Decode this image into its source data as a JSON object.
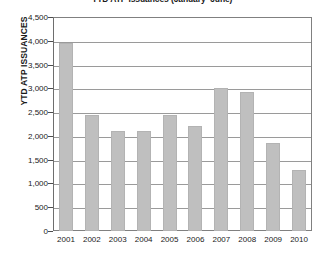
{
  "chart_data": {
    "type": "bar",
    "title": "YTD ATP Issuances (January–June)",
    "xlabel": "",
    "ylabel": "YTD ATP ISSUANCES",
    "categories": [
      "2001",
      "2002",
      "2003",
      "2004",
      "2005",
      "2006",
      "2007",
      "2008",
      "2009",
      "2010"
    ],
    "values": [
      3950,
      2450,
      2100,
      2100,
      2450,
      2200,
      3000,
      2930,
      1850,
      1280
    ],
    "ylim": [
      0,
      4500
    ],
    "ytick_labels": [
      "0",
      "500",
      "1,000",
      "1,500",
      "2,000",
      "2,500",
      "3,000",
      "3,500",
      "4,000",
      "4,500"
    ],
    "ytick_values": [
      0,
      500,
      1000,
      1500,
      2000,
      2500,
      3000,
      3500,
      4000,
      4500
    ],
    "grid": true,
    "legend": false,
    "bar_color": "#bfbfbf",
    "gridline_color": "#9a9a9a",
    "axis_color": "#808080",
    "background_color": "#ffffff",
    "text_color": "#1a1a1a"
  }
}
